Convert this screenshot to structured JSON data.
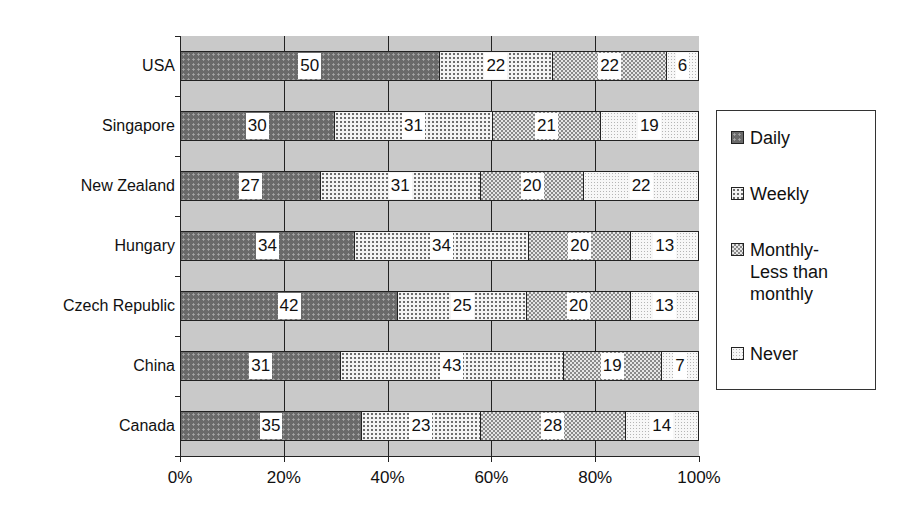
{
  "chart_data": {
    "type": "bar",
    "orientation": "horizontal",
    "stacked": "100%",
    "title": "",
    "xlabel": "",
    "ylabel": "",
    "categories": [
      "USA",
      "Singapore",
      "New Zealand",
      "Hungary",
      "Czech Republic",
      "China",
      "Canada"
    ],
    "series": [
      {
        "name": "Daily",
        "values": [
          50,
          30,
          27,
          34,
          42,
          31,
          35
        ]
      },
      {
        "name": "Weekly",
        "values": [
          22,
          31,
          31,
          34,
          25,
          43,
          23
        ]
      },
      {
        "name": "Monthly-Less than monthly",
        "values": [
          22,
          21,
          20,
          20,
          20,
          19,
          28
        ]
      },
      {
        "name": "Never",
        "values": [
          6,
          19,
          22,
          13,
          13,
          7,
          14
        ]
      }
    ],
    "xlim": [
      0,
      100
    ],
    "x_ticks": [
      "0%",
      "20%",
      "40%",
      "60%",
      "80%",
      "100%"
    ],
    "grid": {
      "vertical": true,
      "horizontal": false
    },
    "legend_position": "right",
    "data_labels": true
  },
  "legend": {
    "items": [
      {
        "label": "Daily",
        "pattern": "daily"
      },
      {
        "label": "Weekly",
        "pattern": "weekly"
      },
      {
        "label": "Monthly-\nLess than\nmonthly",
        "pattern": "monthly"
      },
      {
        "label": "Never",
        "pattern": "never"
      }
    ]
  },
  "colors": {
    "plot_background": "#c9c9c9",
    "daily": "#6a6a6a",
    "weekly": "#f4f4f4",
    "monthly": "#8a8a8a",
    "never": "#f7f7f7"
  }
}
